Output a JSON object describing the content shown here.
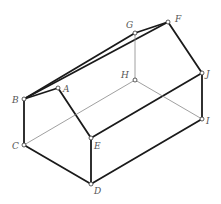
{
  "diagram": {
    "type": "wireframe-house-prism",
    "colors": {
      "edge": "#1a1a1a",
      "hidden_edge": "#888888",
      "vertex_fill": "#ffffff",
      "vertex_stroke": "#333333",
      "label": "#555555"
    },
    "vertices": [
      {
        "id": "A",
        "x": 58,
        "y": 88,
        "lx": 63,
        "ly": 92
      },
      {
        "id": "B",
        "x": 24,
        "y": 99,
        "lx": 12,
        "ly": 103
      },
      {
        "id": "C",
        "x": 24,
        "y": 145,
        "lx": 12,
        "ly": 149
      },
      {
        "id": "D",
        "x": 91,
        "y": 184,
        "lx": 94,
        "ly": 194
      },
      {
        "id": "E",
        "x": 91,
        "y": 138,
        "lx": 94,
        "ly": 149
      },
      {
        "id": "F",
        "x": 168,
        "y": 22,
        "lx": 175,
        "ly": 22
      },
      {
        "id": "G",
        "x": 135,
        "y": 33,
        "lx": 126,
        "ly": 28
      },
      {
        "id": "H",
        "x": 135,
        "y": 80,
        "lx": 121,
        "ly": 78
      },
      {
        "id": "I",
        "x": 202,
        "y": 119,
        "lx": 206,
        "ly": 124
      },
      {
        "id": "J",
        "x": 202,
        "y": 73,
        "lx": 206,
        "ly": 77
      }
    ],
    "edges": [
      {
        "from": "B",
        "to": "G",
        "hidden": false
      },
      {
        "from": "B",
        "to": "F",
        "hidden": false
      },
      {
        "from": "G",
        "to": "F",
        "hidden": false
      },
      {
        "from": "B",
        "to": "A",
        "hidden": false
      },
      {
        "from": "A",
        "to": "E",
        "hidden": false
      },
      {
        "from": "F",
        "to": "J",
        "hidden": false
      },
      {
        "from": "E",
        "to": "J",
        "hidden": false
      },
      {
        "from": "B",
        "to": "C",
        "hidden": false
      },
      {
        "from": "C",
        "to": "D",
        "hidden": false
      },
      {
        "from": "D",
        "to": "E",
        "hidden": false
      },
      {
        "from": "D",
        "to": "I",
        "hidden": false
      },
      {
        "from": "I",
        "to": "J",
        "hidden": false
      },
      {
        "from": "G",
        "to": "H",
        "hidden": true
      },
      {
        "from": "H",
        "to": "C",
        "hidden": true
      },
      {
        "from": "H",
        "to": "I",
        "hidden": true
      }
    ]
  }
}
